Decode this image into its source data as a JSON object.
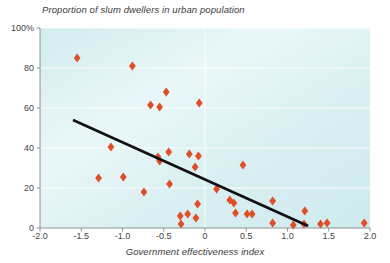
{
  "chart_data": {
    "type": "scatter",
    "title": "Proportion of slum dwellers in urban population",
    "xlabel": "Government effectiveness index",
    "ylabel": "",
    "xlim": [
      -2.0,
      2.0
    ],
    "ylim": [
      0,
      100
    ],
    "grid": true,
    "legend": null,
    "xticks": [
      "-2.0",
      "-1.5",
      "-1.0",
      "-0.5",
      "0",
      "0.5",
      "1.0",
      "1.5",
      "2.0"
    ],
    "xtick_values": [
      -2.0,
      -1.5,
      -1.0,
      -0.5,
      0,
      0.5,
      1.0,
      1.5,
      2.0
    ],
    "yticks": [
      "0",
      "20",
      "40",
      "60",
      "80",
      "100%"
    ],
    "ytick_values": [
      0,
      20,
      40,
      60,
      80,
      100
    ],
    "marker": "diamond",
    "marker_color": "#e04e27",
    "plot_background": "#d9eef0",
    "points": [
      {
        "x": -1.55,
        "y": 85
      },
      {
        "x": -0.88,
        "y": 81
      },
      {
        "x": -0.47,
        "y": 68
      },
      {
        "x": -0.66,
        "y": 61.5
      },
      {
        "x": -0.55,
        "y": 60.5
      },
      {
        "x": -0.07,
        "y": 62.5
      },
      {
        "x": -1.14,
        "y": 40.5
      },
      {
        "x": -0.44,
        "y": 38
      },
      {
        "x": -0.57,
        "y": 35.5
      },
      {
        "x": -0.55,
        "y": 33.5
      },
      {
        "x": -0.19,
        "y": 37
      },
      {
        "x": -0.08,
        "y": 36
      },
      {
        "x": -0.12,
        "y": 30.5
      },
      {
        "x": 0.46,
        "y": 31.5
      },
      {
        "x": -1.29,
        "y": 25
      },
      {
        "x": -0.99,
        "y": 25.5
      },
      {
        "x": -0.43,
        "y": 22
      },
      {
        "x": 0.14,
        "y": 19.5
      },
      {
        "x": -0.74,
        "y": 18
      },
      {
        "x": 0.3,
        "y": 14
      },
      {
        "x": 0.35,
        "y": 12.5
      },
      {
        "x": 0.82,
        "y": 13.5
      },
      {
        "x": -0.09,
        "y": 12
      },
      {
        "x": -0.21,
        "y": 7
      },
      {
        "x": -0.3,
        "y": 6
      },
      {
        "x": -0.11,
        "y": 5
      },
      {
        "x": -0.29,
        "y": 2
      },
      {
        "x": 0.37,
        "y": 7.5
      },
      {
        "x": 0.51,
        "y": 7
      },
      {
        "x": 0.57,
        "y": 7
      },
      {
        "x": 1.21,
        "y": 8.5
      },
      {
        "x": 0.82,
        "y": 2.5
      },
      {
        "x": 1.07,
        "y": 1.5
      },
      {
        "x": 1.2,
        "y": 2
      },
      {
        "x": 1.4,
        "y": 2
      },
      {
        "x": 1.48,
        "y": 2.5
      },
      {
        "x": 1.93,
        "y": 2.5
      }
    ],
    "trendline": {
      "color": "#111111",
      "x_start": -1.6,
      "y_start": 54,
      "x_end": 1.25,
      "y_end": 1
    }
  }
}
